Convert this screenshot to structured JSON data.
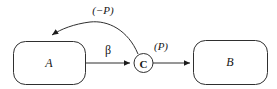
{
  "figure": {
    "type": "node-edge-diagram",
    "background": "#ffffff",
    "stroke_color": "#2f2f2f",
    "text_color": "#161616",
    "nodes": {
      "a": {
        "label": "A",
        "shape": "rounded-rectangle"
      },
      "b": {
        "label": "B",
        "shape": "rounded-rectangle"
      },
      "c": {
        "label": "C",
        "shape": "circle"
      }
    },
    "edges": {
      "a_to_c": {
        "label": "β",
        "from": "A",
        "to": "C",
        "style": "straight-arrow"
      },
      "c_to_b": {
        "label": "(P)",
        "from": "C",
        "to": "B",
        "style": "straight-arrow"
      },
      "c_to_a": {
        "label": "(−P)",
        "from": "C",
        "to": "A",
        "style": "curved-arrow"
      }
    }
  }
}
